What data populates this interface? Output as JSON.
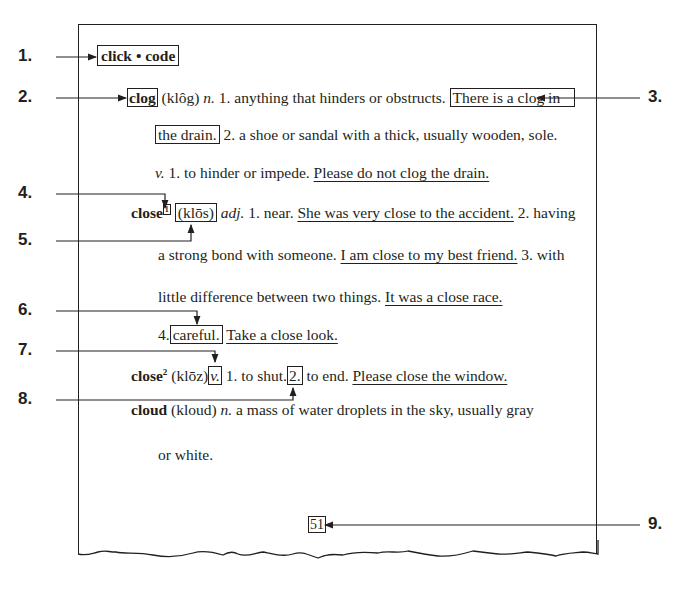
{
  "callouts": [
    "1.",
    "2.",
    "3.",
    "4.",
    "5.",
    "6.",
    "7.",
    "8.",
    "9."
  ],
  "guide_words": {
    "first": "click",
    "separator": "•",
    "last": "code"
  },
  "entries": {
    "clog": {
      "word": "clog",
      "pron": "(klôg)",
      "pos_n": "n.",
      "def1": "1. anything that hinders or obstructs.",
      "ex1_part1": "There is a clog in",
      "ex1_part2": "the drain.",
      "def2": "2. a shoe or sandal with a thick, usually wooden, sole.",
      "pos_v": "v.",
      "def_v1": "1. to hinder or impede.",
      "ex_v1": "Please do not clog the drain."
    },
    "close1": {
      "word": "close",
      "homograph": "1",
      "pron": "(klōs)",
      "pos": "adj.",
      "def1": "1. near.",
      "ex1": "She was very close to the accident.",
      "def2_a": "2. having",
      "def2_b": "a strong bond with someone.",
      "ex2": "I am close to my best friend.",
      "def3_a": "3. with",
      "def3_b": "little difference between two things.",
      "ex3": "It was a close race.",
      "def4_num": "4.",
      "def4": "careful.",
      "ex4": "Take a close look."
    },
    "close2": {
      "word": "close",
      "homograph": "2",
      "pron": "(klōz)",
      "pos": "v.",
      "def1": "1. to shut.",
      "def2_num": "2.",
      "def2": "to end.",
      "ex2": "Please close the window."
    },
    "cloud": {
      "word": "cloud",
      "pron": "(kloud)",
      "pos": "n.",
      "def_a": "a mass of water droplets in the sky, usually gray",
      "def_b": "or white."
    }
  },
  "page_number": "51",
  "colors": {
    "ink": "#231f20",
    "background": "#ffffff"
  }
}
